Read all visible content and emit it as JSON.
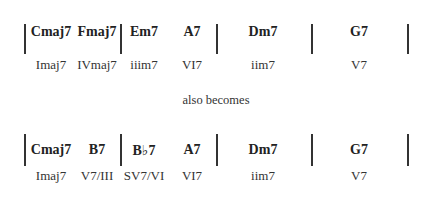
{
  "progression_original": {
    "chords": [
      "Cmaj7",
      "Fmaj7",
      "Em7",
      "A7",
      "Dm7",
      "G7"
    ],
    "numerals": [
      "Imaj7",
      "IVmaj7",
      "iiim7",
      "VI7",
      "iim7",
      "V7"
    ]
  },
  "connector_text": "also becomes",
  "progression_substituted": {
    "chords": [
      "Cmaj7",
      "B7",
      "B♭7",
      "A7",
      "Dm7",
      "G7"
    ],
    "numerals": [
      "Imaj7",
      "V7/III",
      "SV7/VI",
      "VI7",
      "iim7",
      "V7"
    ]
  }
}
